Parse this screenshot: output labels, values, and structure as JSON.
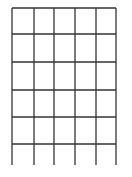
{
  "diagram": {
    "type": "grid",
    "columns": 5,
    "rows": 6,
    "line_color": "#333333",
    "background": "#ffffff",
    "vertical_lines_x": [
      12,
      34,
      54,
      75,
      96,
      116
    ],
    "horizontal_lines_y": [
      8,
      34,
      62,
      90,
      117,
      144
    ],
    "top": 8,
    "bottom": 165,
    "left": 12,
    "right": 116,
    "bottom_row_open": true
  }
}
